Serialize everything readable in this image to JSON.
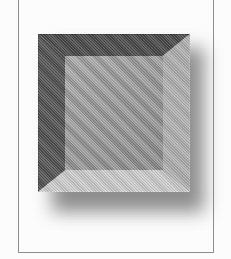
{
  "figure": {
    "kind": "beveled-square-illustration",
    "caption": "",
    "alt_description": "Grey beveled square with dark upper-left bevels, light lower-right bevels and a soft drop shadow",
    "background_color": "#fdfdfd",
    "rules": {
      "color": "#8e8e8e",
      "left_label": "left page rule",
      "right_label": "right page rule",
      "bottom_label": "bottom page rule"
    },
    "object": {
      "name": "beveled-square",
      "inner_panel_color": "#9e9e9e",
      "bevel_top_color": "#4a4a4a",
      "bevel_left_color": "#535353",
      "bevel_right_color": "#b2b2b2",
      "bevel_bottom_color": "#cfcfcf",
      "shadow_color": "#6f6f6f",
      "x": 38,
      "y": 34,
      "width": 152,
      "height": 158
    }
  }
}
